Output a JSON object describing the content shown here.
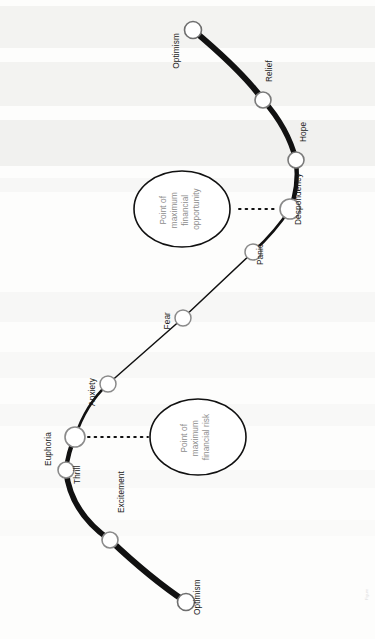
{
  "figure": {
    "orientation": "rotated-90-ccw",
    "line_color": "#111111",
    "node_fill": "#ffffff",
    "node_stroke": "#8f8f8f",
    "callout_text_color": "#8d8d8d"
  },
  "nodes": [
    {
      "label": "Optimism",
      "cx": 193,
      "cy": 30,
      "r": 8.5,
      "stroke": "#6e6e6e",
      "phase": "start"
    },
    {
      "label": "Relief",
      "cx": 263,
      "cy": 100,
      "r": 8.0,
      "stroke": "#7a7a7a",
      "phase": "decline"
    },
    {
      "label": "Hope",
      "cx": 296,
      "cy": 160,
      "r": 8.0,
      "stroke": "#7a7a7a",
      "phase": "decline"
    },
    {
      "label": "Despondency",
      "cx": 290,
      "cy": 209,
      "r": 10.0,
      "stroke": "#8a8a8a",
      "phase": "bottom"
    },
    {
      "label": "Panic",
      "cx": 253,
      "cy": 252,
      "r": 8.0,
      "stroke": "#8a8a8a",
      "phase": "bottom"
    },
    {
      "label": "Fear",
      "cx": 183,
      "cy": 318,
      "r": 8.0,
      "stroke": "#8a8a8a",
      "phase": "recovery"
    },
    {
      "label": "Anxiety",
      "cx": 108,
      "cy": 384,
      "r": 8.0,
      "stroke": "#8a8a8a",
      "phase": "recovery"
    },
    {
      "label": "Euphoria",
      "cx": 75,
      "cy": 437,
      "r": 10.0,
      "stroke": "#8a8a8a",
      "phase": "peak"
    },
    {
      "label": "Thrill",
      "cx": 66,
      "cy": 470,
      "r": 8.0,
      "stroke": "#8a8a8a",
      "phase": "rise"
    },
    {
      "label": "Excitement",
      "cx": 110,
      "cy": 540,
      "r": 8.0,
      "stroke": "#8a8a8a",
      "phase": "rise"
    },
    {
      "label": "Optimism",
      "cx": 186,
      "cy": 602,
      "r": 8.5,
      "stroke": "#6e6e6e",
      "phase": "end"
    }
  ],
  "callouts": [
    {
      "id": "opportunity",
      "lines": [
        "Point of",
        "maximum",
        "financial",
        "opportunity"
      ],
      "cx": 182,
      "cy": 209,
      "rx": 48,
      "ry": 38,
      "connects_to": "Despondency"
    },
    {
      "id": "risk",
      "lines": [
        "Point of",
        "maximum",
        "financial risk"
      ],
      "cx": 198,
      "cy": 437,
      "rx": 48,
      "ry": 38,
      "connects_to": "Euphoria"
    }
  ],
  "edge_caption": "Figure"
}
